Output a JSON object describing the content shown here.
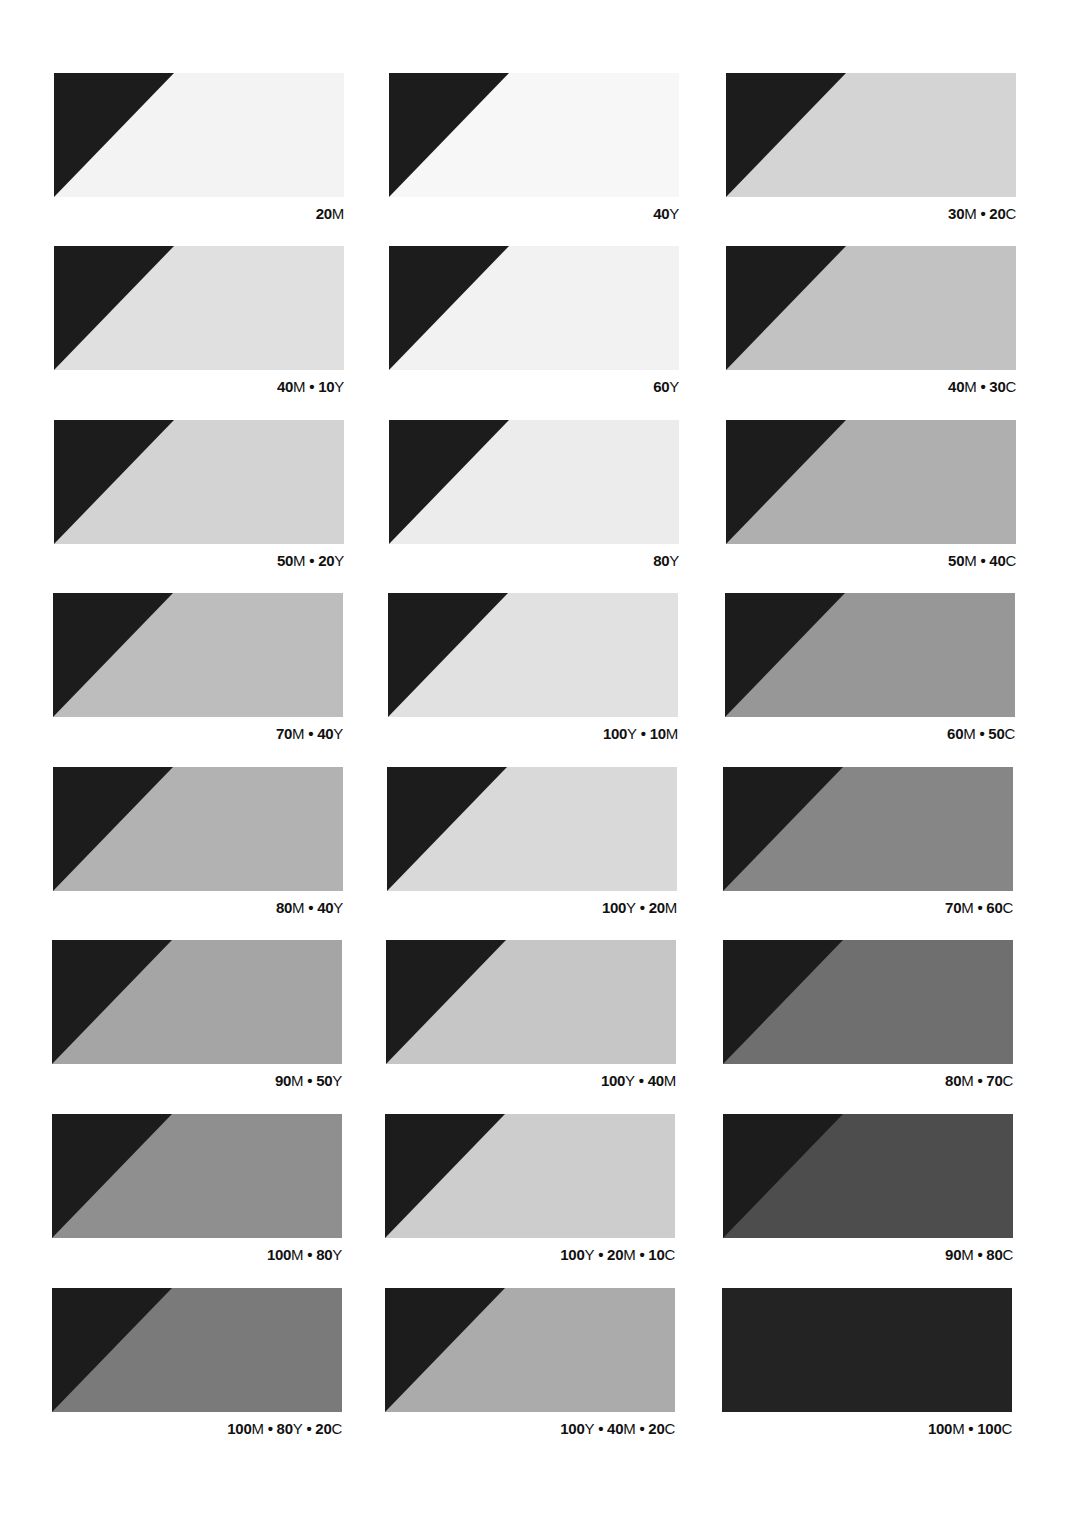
{
  "page": {
    "background": "#ffffff",
    "triangle_color": "#1c1c1c"
  },
  "swatches": [
    {
      "label": "20M",
      "parts": [
        [
          "20",
          "M"
        ]
      ],
      "color": "#f3f3f3",
      "col": 0,
      "row": 0
    },
    {
      "label": "40Y",
      "parts": [
        [
          "40",
          "Y"
        ]
      ],
      "color": "#f7f7f7",
      "col": 1,
      "row": 0
    },
    {
      "label": "30M • 20C",
      "parts": [
        [
          "30",
          "M"
        ],
        [
          "20",
          "C"
        ]
      ],
      "color": "#d4d4d4",
      "col": 2,
      "row": 0
    },
    {
      "label": "40M • 10Y",
      "parts": [
        [
          "40",
          "M"
        ],
        [
          "10",
          "Y"
        ]
      ],
      "color": "#e0e0e0",
      "col": 0,
      "row": 1
    },
    {
      "label": "60Y",
      "parts": [
        [
          "60",
          "Y"
        ]
      ],
      "color": "#f2f2f2",
      "col": 1,
      "row": 1
    },
    {
      "label": "40M • 30C",
      "parts": [
        [
          "40",
          "M"
        ],
        [
          "30",
          "C"
        ]
      ],
      "color": "#c2c2c2",
      "col": 2,
      "row": 1
    },
    {
      "label": "50M • 20Y",
      "parts": [
        [
          "50",
          "M"
        ],
        [
          "20",
          "Y"
        ]
      ],
      "color": "#d3d3d3",
      "col": 0,
      "row": 2
    },
    {
      "label": "80Y",
      "parts": [
        [
          "80",
          "Y"
        ]
      ],
      "color": "#ececec",
      "col": 1,
      "row": 2
    },
    {
      "label": "50M • 40C",
      "parts": [
        [
          "50",
          "M"
        ],
        [
          "40",
          "C"
        ]
      ],
      "color": "#afafaf",
      "col": 2,
      "row": 2
    },
    {
      "label": "70M • 40Y",
      "parts": [
        [
          "70",
          "M"
        ],
        [
          "40",
          "Y"
        ]
      ],
      "color": "#bdbdbd",
      "col": 0,
      "row": 3
    },
    {
      "label": "100Y • 10M",
      "parts": [
        [
          "100",
          "Y"
        ],
        [
          "10",
          "M"
        ]
      ],
      "color": "#e1e1e1",
      "col": 1,
      "row": 3
    },
    {
      "label": "60M • 50C",
      "parts": [
        [
          "60",
          "M"
        ],
        [
          "50",
          "C"
        ]
      ],
      "color": "#979797",
      "col": 2,
      "row": 3
    },
    {
      "label": "80M • 40Y",
      "parts": [
        [
          "80",
          "M"
        ],
        [
          "40",
          "Y"
        ]
      ],
      "color": "#b2b2b2",
      "col": 0,
      "row": 4
    },
    {
      "label": "100Y • 20M",
      "parts": [
        [
          "100",
          "Y"
        ],
        [
          "20",
          "M"
        ]
      ],
      "color": "#d9d9d9",
      "col": 1,
      "row": 4
    },
    {
      "label": "70M • 60C",
      "parts": [
        [
          "70",
          "M"
        ],
        [
          "60",
          "C"
        ]
      ],
      "color": "#868686",
      "col": 2,
      "row": 4
    },
    {
      "label": "90M • 50Y",
      "parts": [
        [
          "90",
          "M"
        ],
        [
          "50",
          "Y"
        ]
      ],
      "color": "#a5a5a5",
      "col": 0,
      "row": 5
    },
    {
      "label": "100Y • 40M",
      "parts": [
        [
          "100",
          "Y"
        ],
        [
          "40",
          "M"
        ]
      ],
      "color": "#c6c6c6",
      "col": 1,
      "row": 5
    },
    {
      "label": "80M • 70C",
      "parts": [
        [
          "80",
          "M"
        ],
        [
          "70",
          "C"
        ]
      ],
      "color": "#6f6f6f",
      "col": 2,
      "row": 5
    },
    {
      "label": "100M • 80Y",
      "parts": [
        [
          "100",
          "M"
        ],
        [
          "80",
          "Y"
        ]
      ],
      "color": "#8f8f8f",
      "col": 0,
      "row": 6
    },
    {
      "label": "100Y • 20M • 10C",
      "parts": [
        [
          "100",
          "Y"
        ],
        [
          "20",
          "M"
        ],
        [
          "10",
          "C"
        ]
      ],
      "color": "#cdcdcd",
      "col": 1,
      "row": 6
    },
    {
      "label": "90M • 80C",
      "parts": [
        [
          "90",
          "M"
        ],
        [
          "80",
          "C"
        ]
      ],
      "color": "#4d4d4d",
      "col": 2,
      "row": 6
    },
    {
      "label": "100M • 80Y • 20C",
      "parts": [
        [
          "100",
          "M"
        ],
        [
          "80",
          "Y"
        ],
        [
          "20",
          "C"
        ]
      ],
      "color": "#7a7a7a",
      "col": 0,
      "row": 7
    },
    {
      "label": "100Y • 40M • 20C",
      "parts": [
        [
          "100",
          "Y"
        ],
        [
          "40",
          "M"
        ],
        [
          "20",
          "C"
        ]
      ],
      "color": "#ababab",
      "col": 1,
      "row": 7
    },
    {
      "label": "100M • 100C",
      "parts": [
        [
          "100",
          "M"
        ],
        [
          "100",
          "C"
        ]
      ],
      "color": "#232323",
      "col": 2,
      "row": 7
    }
  ],
  "layout": {
    "col_x": [
      54,
      389,
      726
    ],
    "row_y": [
      73,
      246,
      420,
      593,
      767,
      940,
      1114,
      1288
    ],
    "row_dx": [
      [
        0,
        0,
        0
      ],
      [
        0,
        0,
        0
      ],
      [
        0,
        0,
        0
      ],
      [
        -1,
        -1,
        -1
      ],
      [
        -1,
        -2,
        -3
      ],
      [
        -2,
        -3,
        -3
      ],
      [
        -2,
        -4,
        -3
      ],
      [
        -2,
        -4,
        -4
      ]
    ]
  }
}
